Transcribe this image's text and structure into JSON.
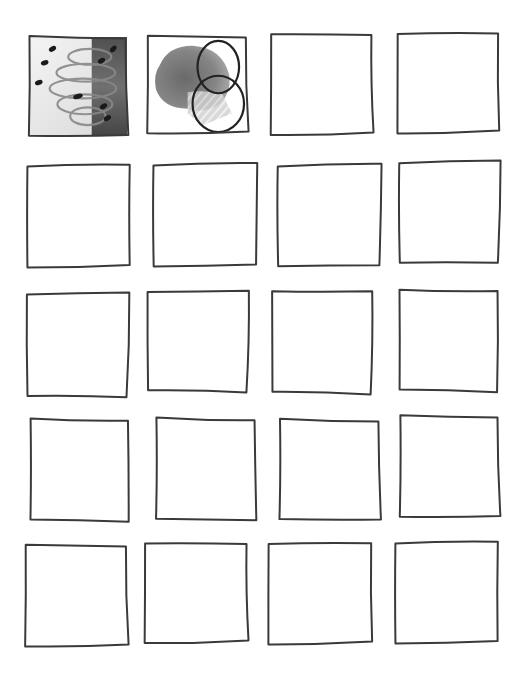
{
  "page": {
    "background": "#ffffff",
    "stroke_color": "#3a3a3a",
    "rows": 5,
    "columns": 4
  },
  "cells": [
    {
      "id": "r1c1",
      "row": 1,
      "col": 1,
      "x": 29,
      "y": 37,
      "w": 98,
      "h": 99,
      "content": "watercolor-petal-study",
      "filled": true
    },
    {
      "id": "r1c2",
      "row": 1,
      "col": 2,
      "x": 148,
      "y": 36,
      "w": 99,
      "h": 97,
      "content": "watercolor-blob-with-overlapping-circles",
      "filled": true
    },
    {
      "id": "r1c3",
      "row": 1,
      "col": 3,
      "x": 272,
      "y": 34,
      "w": 100,
      "h": 100,
      "content": "empty",
      "filled": false
    },
    {
      "id": "r1c4",
      "row": 1,
      "col": 4,
      "x": 399,
      "y": 33,
      "w": 99,
      "h": 99,
      "content": "empty",
      "filled": false
    },
    {
      "id": "r2c1",
      "row": 2,
      "col": 1,
      "x": 29,
      "y": 165,
      "w": 100,
      "h": 101,
      "content": "empty",
      "filled": false
    },
    {
      "id": "r2c2",
      "row": 2,
      "col": 2,
      "x": 155,
      "y": 164,
      "w": 101,
      "h": 101,
      "content": "empty",
      "filled": false
    },
    {
      "id": "r2c3",
      "row": 2,
      "col": 3,
      "x": 279,
      "y": 165,
      "w": 101,
      "h": 100,
      "content": "empty",
      "filled": false
    },
    {
      "id": "r2c4",
      "row": 2,
      "col": 4,
      "x": 400,
      "y": 162,
      "w": 99,
      "h": 100,
      "content": "empty",
      "filled": false
    },
    {
      "id": "r3c1",
      "row": 3,
      "col": 1,
      "x": 27,
      "y": 294,
      "w": 101,
      "h": 102,
      "content": "empty",
      "filled": false
    },
    {
      "id": "r3c2",
      "row": 3,
      "col": 2,
      "x": 147,
      "y": 292,
      "w": 101,
      "h": 99,
      "content": "empty",
      "filled": false
    },
    {
      "id": "r3c3",
      "row": 3,
      "col": 3,
      "x": 271,
      "y": 292,
      "w": 101,
      "h": 101,
      "content": "empty",
      "filled": false
    },
    {
      "id": "r3c4",
      "row": 3,
      "col": 4,
      "x": 398,
      "y": 291,
      "w": 100,
      "h": 100,
      "content": "empty",
      "filled": false
    },
    {
      "id": "r4c1",
      "row": 4,
      "col": 1,
      "x": 29,
      "y": 420,
      "w": 100,
      "h": 101,
      "content": "empty",
      "filled": false
    },
    {
      "id": "r4c2",
      "row": 4,
      "col": 2,
      "x": 155,
      "y": 419,
      "w": 101,
      "h": 101,
      "content": "empty",
      "filled": false
    },
    {
      "id": "r4c3",
      "row": 4,
      "col": 3,
      "x": 279,
      "y": 420,
      "w": 101,
      "h": 100,
      "content": "empty",
      "filled": false
    },
    {
      "id": "r4c4",
      "row": 4,
      "col": 4,
      "x": 400,
      "y": 416,
      "w": 99,
      "h": 101,
      "content": "empty",
      "filled": false
    },
    {
      "id": "r5c1",
      "row": 5,
      "col": 1,
      "x": 26,
      "y": 545,
      "w": 101,
      "h": 101,
      "content": "empty",
      "filled": false
    },
    {
      "id": "r5c2",
      "row": 5,
      "col": 2,
      "x": 146,
      "y": 543,
      "w": 101,
      "h": 99,
      "content": "empty",
      "filled": false
    },
    {
      "id": "r5c3",
      "row": 5,
      "col": 3,
      "x": 270,
      "y": 543,
      "w": 101,
      "h": 100,
      "content": "empty",
      "filled": false
    },
    {
      "id": "r5c4",
      "row": 5,
      "col": 4,
      "x": 397,
      "y": 542,
      "w": 100,
      "h": 100,
      "content": "empty",
      "filled": false
    }
  ]
}
